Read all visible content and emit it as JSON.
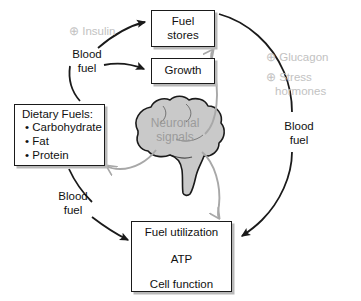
{
  "diagram": {
    "colors": {
      "box_border": "#1a1a1a",
      "box_shadow": "#b9b9b9",
      "black_arrow": "#1a1a1a",
      "gray_arrow": "#a8a8a8",
      "brain_fill": "#c9c9c9",
      "brain_stroke": "#1a1a1a",
      "modulator_text": "#c2c2c2",
      "brain_text": "#9b9b9b",
      "background": "#ffffff"
    },
    "boxes": {
      "fuel_stores": {
        "line1": "Fuel",
        "line2": "stores"
      },
      "growth": {
        "line1": "Growth"
      },
      "dietary_fuels": {
        "heading": "Dietary Fuels:",
        "items": [
          "• Carbohydrate",
          "• Fat",
          "• Protein"
        ]
      },
      "fuel_utilization": {
        "line1": "Fuel utilization",
        "line2": "ATP",
        "line3": "Cell function"
      }
    },
    "labels": {
      "blood_fuel_top": "Blood fuel",
      "blood_fuel_top_l1": "Blood",
      "blood_fuel_top_l2": "fuel",
      "blood_fuel_left_l1": "Blood",
      "blood_fuel_left_l2": "fuel",
      "blood_fuel_right_l1": "Blood",
      "blood_fuel_right_l2": "fuel",
      "insulin": "⊕ Insulin",
      "glucagon": "⊕ Glucagon",
      "stress_l1": "⊕ Stress",
      "stress_l2": "hormones",
      "neuronal_l1": "Neuronal",
      "neuronal_l2": "signals"
    },
    "connections": [
      {
        "name": "blood-fuel-to-fuel-stores",
        "from": "Blood fuel (top)",
        "to": "Fuel stores",
        "style": "black-arrow"
      },
      {
        "name": "blood-fuel-to-growth",
        "from": "Blood fuel (top)",
        "to": "Growth",
        "style": "black-arrow"
      },
      {
        "name": "dietary-fuels-to-blood-fuel-top",
        "from": "Dietary Fuels",
        "to": "Blood fuel (top)",
        "style": "black-curve"
      },
      {
        "name": "dietary-fuels-to-fuel-utilization",
        "from": "Dietary Fuels",
        "to": "Fuel utilization",
        "style": "black-arrow"
      },
      {
        "name": "fuel-stores-to-fuel-utilization",
        "from": "Fuel stores",
        "to": "Fuel utilization",
        "style": "black-arrow"
      },
      {
        "name": "brain-to-fuel-stores",
        "from": "Neuronal signals",
        "to": "Fuel stores",
        "style": "gray-open-arrow"
      },
      {
        "name": "brain-to-dietary-fuels",
        "from": "Neuronal signals",
        "to": "Dietary Fuels",
        "style": "gray-open-arrow"
      },
      {
        "name": "brain-to-fuel-utilization",
        "from": "Neuronal signals",
        "to": "Fuel utilization",
        "style": "gray-open-arrow"
      },
      {
        "name": "fuel-utilization-to-atp",
        "from": "Fuel utilization",
        "to": "ATP",
        "style": "black-arrow"
      },
      {
        "name": "atp-to-cell-function",
        "from": "ATP",
        "to": "Cell function",
        "style": "black-arrow"
      },
      {
        "name": "fuel-utilization-to-cell-function",
        "from": "Fuel utilization",
        "to": "Cell function",
        "style": "black-arrow"
      }
    ]
  }
}
